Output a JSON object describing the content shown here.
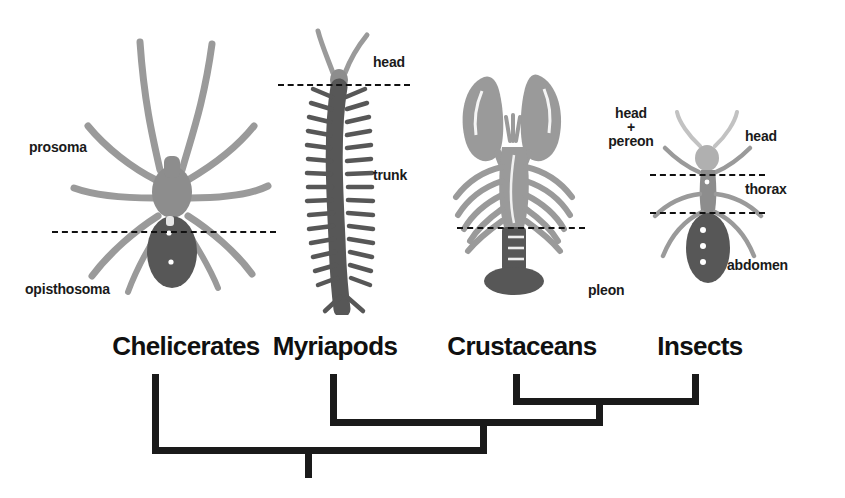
{
  "figure": {
    "background": "#ffffff",
    "ink": "#1a1a1a",
    "silhouette_light": "#9a9a9a",
    "silhouette_dark": "#575757",
    "silhouette_mid": "#8d8d8d"
  },
  "taxa": [
    {
      "id": "chelicerates",
      "name": "Chelicerates",
      "organism": "spider",
      "parts": [
        {
          "id": "prosoma",
          "label": "prosoma"
        },
        {
          "id": "opisthosoma",
          "label": "opisthosoma"
        }
      ],
      "divider_count": 1
    },
    {
      "id": "myriapods",
      "name": "Myriapods",
      "organism": "centipede",
      "parts": [
        {
          "id": "head",
          "label": "head"
        },
        {
          "id": "trunk",
          "label": "trunk"
        }
      ],
      "divider_count": 1
    },
    {
      "id": "crustaceans",
      "name": "Crustaceans",
      "organism": "lobster",
      "parts": [
        {
          "id": "head-pereon",
          "label": "head\n+\npereon",
          "line1": "head",
          "line2": "+",
          "line3": "pereon"
        },
        {
          "id": "pleon",
          "label": "pleon"
        }
      ],
      "divider_count": 1
    },
    {
      "id": "insects",
      "name": "Insects",
      "organism": "ant",
      "parts": [
        {
          "id": "head",
          "label": "head"
        },
        {
          "id": "thorax",
          "label": "thorax"
        },
        {
          "id": "abdomen",
          "label": "abdomen"
        }
      ],
      "divider_count": 2
    }
  ],
  "cladogram": {
    "root_label": "",
    "topology": "(Chelicerates,(Myriapods,(Crustaceans,Insects)))",
    "nodes": [
      {
        "id": "node-crustaceans-insects",
        "children": [
          "crustaceans",
          "insects"
        ],
        "depth": 1
      },
      {
        "id": "node-mandibulata",
        "children": [
          "myriapods",
          "node-crustaceans-insects"
        ],
        "depth": 2
      },
      {
        "id": "node-arthropoda",
        "children": [
          "chelicerates",
          "node-mandibulata"
        ],
        "depth": 3
      }
    ]
  }
}
